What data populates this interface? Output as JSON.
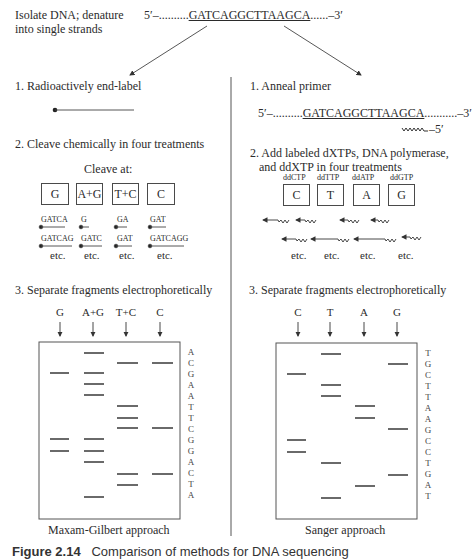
{
  "header": {
    "intro_line1": "Isolate DNA; denature",
    "intro_line2": "into single strands",
    "strand_prefix": "5′–..........",
    "strand_seq": "GATCAGGCTTAAGCA",
    "strand_suffix": "......–3′"
  },
  "maxam": {
    "step1": "1. Radioactively end-label",
    "step2": "2. Cleave chemically in four treatments",
    "cleave_at": "Cleave at:",
    "treatments": [
      "G",
      "A+G",
      "T+C",
      "C"
    ],
    "fragments_row1": [
      "GATCA",
      "G",
      "GA",
      "GAT"
    ],
    "fragments_row2": [
      "GATCAG",
      "GATC",
      "GAT",
      "GATCAGG"
    ],
    "etc": "etc.",
    "step3": "3. Separate fragments electrophoretically",
    "lanes": [
      "G",
      "A+G",
      "T+C",
      "C"
    ],
    "sequence_read": [
      "A",
      "C",
      "G",
      "A",
      "A",
      "T",
      "T",
      "C",
      "G",
      "G",
      "A",
      "C",
      "T",
      "A"
    ],
    "label": "Maxam-Gilbert approach"
  },
  "sanger": {
    "step1": "1. Anneal primer",
    "template_prefix": "5′–..........",
    "template_seq": "GATCAGGCTTAAGCA",
    "template_suffix": "...........–3′",
    "primer_end": "–5′",
    "step2_line1": "2. Add labeled dXTPs, DNA polymerase,",
    "step2_line2": "and ddXTP in four treatments",
    "dd_labels": [
      "ddCTP",
      "ddTTP",
      "ddATP",
      "ddGTP"
    ],
    "treatments": [
      "C",
      "T",
      "A",
      "G"
    ],
    "etc": "etc.",
    "step3": "3. Separate fragments electrophoretically",
    "lanes": [
      "C",
      "T",
      "A",
      "G"
    ],
    "sequence_read": [
      "T",
      "G",
      "C",
      "T",
      "T",
      "A",
      "A",
      "G",
      "C",
      "C",
      "T",
      "G",
      "A",
      "T"
    ],
    "label": "Sanger approach"
  },
  "caption": {
    "label": "Figure 2.14",
    "text": "Comparison of methods for DNA sequencing"
  }
}
